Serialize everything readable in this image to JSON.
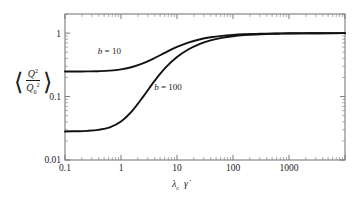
{
  "chart_data": {
    "type": "line",
    "title": "",
    "xlabel": "λ_c γ̇",
    "ylabel": "⟨Q²/Q₀²⟩",
    "xscale": "log",
    "yscale": "log",
    "xlim": [
      0.1,
      10000
    ],
    "ylim": [
      0.01,
      2
    ],
    "grid": false,
    "legend_position": "inline-annotations",
    "xticks": [
      "0.1",
      "1",
      "10",
      "100",
      "1000"
    ],
    "xtick_values": [
      0.1,
      1,
      10,
      100,
      1000
    ],
    "yticks": [
      "1",
      "0.1",
      "0.01"
    ],
    "ytick_values": [
      1,
      0.1,
      0.01
    ],
    "series": [
      {
        "name": "b = 10",
        "label": "b = 10",
        "plateau_low": 0.25,
        "plateau_high": 1.0,
        "x": [
          0.1,
          0.158,
          0.251,
          0.398,
          0.631,
          1.0,
          1.585,
          2.512,
          3.981,
          6.31,
          10.0,
          15.85,
          25.12,
          39.81,
          63.1,
          100.0,
          158.5,
          251.2,
          398.1,
          631.0,
          1000.0,
          2512.0,
          6310.0,
          10000.0
        ],
        "y": [
          0.248,
          0.248,
          0.249,
          0.251,
          0.256,
          0.268,
          0.292,
          0.336,
          0.405,
          0.498,
          0.604,
          0.706,
          0.793,
          0.859,
          0.906,
          0.938,
          0.959,
          0.973,
          0.982,
          0.988,
          0.992,
          0.996,
          0.998,
          0.999
        ]
      },
      {
        "name": "b = 100",
        "label": "b = 100",
        "plateau_low": 0.028,
        "plateau_high": 1.0,
        "x": [
          0.1,
          0.158,
          0.251,
          0.398,
          0.631,
          1.0,
          1.585,
          2.512,
          3.981,
          6.31,
          10.0,
          15.85,
          25.12,
          39.81,
          63.1,
          100.0,
          158.5,
          251.2,
          398.1,
          631.0,
          1000.0,
          2512.0,
          6310.0,
          10000.0
        ],
        "y": [
          0.0282,
          0.0284,
          0.0288,
          0.0299,
          0.0328,
          0.0404,
          0.0594,
          0.1006,
          0.177,
          0.288,
          0.419,
          0.552,
          0.672,
          0.769,
          0.842,
          0.893,
          0.928,
          0.952,
          0.968,
          0.979,
          0.986,
          0.994,
          0.997,
          0.998
        ]
      }
    ],
    "annotations": [
      {
        "text": "b = 10",
        "x": 0.62,
        "y": 0.47
      },
      {
        "text": "b = 100",
        "x": 6.9,
        "y": 0.125
      }
    ]
  },
  "axis": {
    "y_title_parts": {
      "open_bracket": "⟨",
      "numerator": "Q",
      "numerator_sup": "2",
      "denominator": "Q",
      "denominator_sub": "0",
      "denominator_sup": "2",
      "close_bracket": "⟩"
    },
    "x_title_parts": {
      "lambda": "λ",
      "lambda_sub": "c",
      "gamma_dot": "γ̇"
    }
  },
  "colors": {
    "curve": "#111111",
    "frame": "#7a7a7a",
    "text": "#1a1a1a",
    "background": "#ffffff"
  }
}
